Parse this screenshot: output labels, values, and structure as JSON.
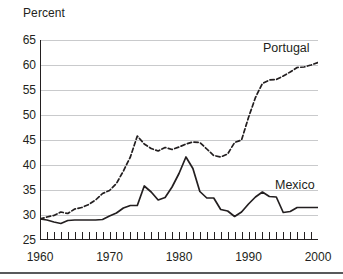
{
  "chart_data": {
    "type": "line",
    "title": "",
    "subtitle": "",
    "xlabel": "",
    "ylabel": "Percent",
    "xlim": [
      1960,
      2000
    ],
    "ylim": [
      25,
      65
    ],
    "yticks": [
      25,
      30,
      35,
      40,
      45,
      50,
      55,
      60,
      65
    ],
    "ytick_labels": [
      "25",
      "30",
      "35",
      "40",
      "45",
      "50",
      "55",
      "60",
      "65"
    ],
    "xticks": [
      1960,
      1970,
      1980,
      1990,
      2000
    ],
    "xtick_labels": [
      "1960",
      "1970",
      "1980",
      "1990",
      "2000"
    ],
    "x_minor_tick_interval": 1,
    "grid": "horizontal",
    "legend_position": "inline-right",
    "x": [
      1960,
      1961,
      1962,
      1963,
      1964,
      1965,
      1966,
      1967,
      1968,
      1969,
      1970,
      1971,
      1972,
      1973,
      1974,
      1975,
      1976,
      1977,
      1978,
      1979,
      1980,
      1981,
      1982,
      1983,
      1984,
      1985,
      1986,
      1987,
      1988,
      1989,
      1990,
      1991,
      1992,
      1993,
      1994,
      1995,
      1996,
      1997,
      1998,
      1999,
      2000
    ],
    "series": [
      {
        "name": "Portugal",
        "style": "dashed",
        "color": "#231f20",
        "values": [
          29.2,
          29.6,
          29.9,
          30.6,
          30.3,
          31.2,
          31.5,
          32.1,
          33.0,
          34.3,
          34.9,
          36.3,
          38.8,
          41.6,
          45.8,
          44.2,
          43.3,
          42.8,
          43.5,
          43.1,
          43.6,
          44.2,
          44.6,
          44.5,
          43.2,
          41.9,
          41.6,
          42.2,
          44.5,
          45.0,
          49.5,
          53.5,
          56.3,
          57.0,
          57.1,
          57.8,
          58.6,
          59.5,
          59.6,
          60.0,
          60.5
        ]
      },
      {
        "name": "Mexico",
        "style": "solid",
        "color": "#231f20",
        "values": [
          29.2,
          29.0,
          28.6,
          28.3,
          28.9,
          29.0,
          29.0,
          29.0,
          29.0,
          29.1,
          29.8,
          30.4,
          31.4,
          31.9,
          31.9,
          35.8,
          34.6,
          33.0,
          33.5,
          35.6,
          38.3,
          41.6,
          39.3,
          34.7,
          33.4,
          33.4,
          31.1,
          30.8,
          29.7,
          30.6,
          32.2,
          33.6,
          34.6,
          33.7,
          33.6,
          30.5,
          30.7,
          31.5,
          31.5,
          31.5,
          31.5
        ]
      }
    ]
  }
}
